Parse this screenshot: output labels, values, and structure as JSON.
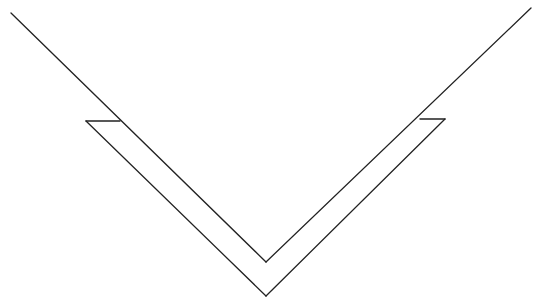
{
  "diagram": {
    "type": "line-drawing",
    "stroke_color": "#222222",
    "background": "#ffffff",
    "lines": {
      "inner_left": [
        [
          11,
          13
        ],
        [
          266,
          262
        ]
      ],
      "inner_right": [
        [
          266,
          262
        ],
        [
          531,
          8
        ]
      ],
      "outer_left": [
        [
          86,
          121
        ],
        [
          266,
          296
        ]
      ],
      "outer_right": [
        [
          266,
          296
        ],
        [
          445,
          119
        ]
      ],
      "left_ledge": [
        [
          86,
          121
        ],
        [
          120,
          121
        ]
      ],
      "right_ledge": [
        [
          420,
          119
        ],
        [
          445,
          119
        ]
      ]
    }
  }
}
